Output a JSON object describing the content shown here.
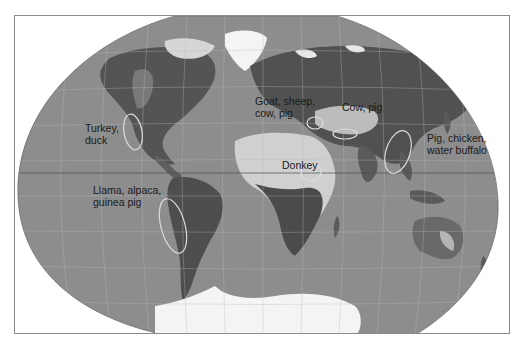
{
  "figure": {
    "type": "world-map",
    "projection": "Winkel-tripel style (oval)",
    "colors": {
      "ocean": "#8e8e8e",
      "land_dark": "#4d4d4d",
      "land_mid": "#6b6b6b",
      "land_light": "#c9c9c9",
      "ice": "#f4f4f4",
      "graticule": "#b8b8b8",
      "highlight_ellipse": "#d9d9d9",
      "frame_border": "#8a8a8a",
      "label_text": "#1a1a1a"
    },
    "labels": [
      {
        "id": "north-america",
        "text": "Turkey,\nduck"
      },
      {
        "id": "south-america",
        "text": "Llama, alpaca,\nguinea pig"
      },
      {
        "id": "near-east",
        "text": "Goat, sheep,\ncow, pig"
      },
      {
        "id": "central-asia",
        "text": "Cow, pig"
      },
      {
        "id": "africa",
        "text": "Donkey"
      },
      {
        "id": "east-asia",
        "text": "Pig, chicken,\nwater buffalo"
      }
    ],
    "domestication_regions": [
      {
        "id": "mesoamerica",
        "label_ref": "north-america"
      },
      {
        "id": "andes",
        "label_ref": "south-america"
      },
      {
        "id": "fertile-crescent",
        "label_ref": "near-east"
      },
      {
        "id": "central-asia",
        "label_ref": "central-asia"
      },
      {
        "id": "northeast-africa",
        "label_ref": "africa"
      },
      {
        "id": "china",
        "label_ref": "east-asia"
      }
    ]
  },
  "caption": {
    "visible": "partially cut off"
  }
}
